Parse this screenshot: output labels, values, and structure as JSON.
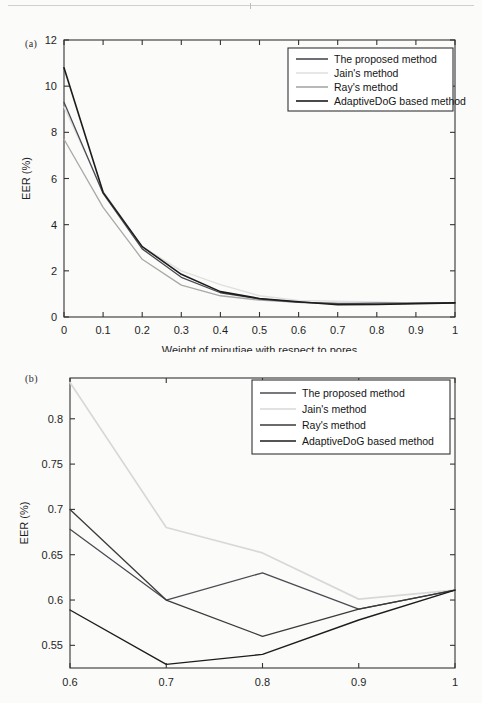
{
  "page": {
    "background_color": "#fbfbfa",
    "figure_count": 2
  },
  "series_styles": {
    "proposed": "#4a4a52",
    "jain": "#d2d2d2",
    "ray": "#9a9a9a",
    "adaptivedog": "#1c1c1c"
  },
  "figure_a": {
    "panel_tag": "(a)",
    "legend": {
      "position": "top-right",
      "items": [
        {
          "label": "The proposed method",
          "color": "#4a4a52"
        },
        {
          "label": "Jain's method",
          "color": "#e2e2e2"
        },
        {
          "label": "Ray's method",
          "color": "#a8a8a8"
        },
        {
          "label": "AdaptiveDoG based method",
          "color": "#1c1c1c"
        }
      ]
    },
    "chart_data": {
      "type": "line",
      "title": "",
      "xlabel": "Weight of minutiae with respect to pores",
      "ylabel": "EER (%)",
      "xlim": [
        0,
        1
      ],
      "ylim": [
        0,
        12
      ],
      "grid": false,
      "legend_position": "upper right",
      "xticks": [
        "0",
        "0.1",
        "0.2",
        "0.3",
        "0.4",
        "0.5",
        "0.6",
        "0.7",
        "0.8",
        "0.9",
        "1"
      ],
      "xtick_values": [
        0,
        0.1,
        0.2,
        0.3,
        0.4,
        0.5,
        0.6,
        0.7,
        0.8,
        0.9,
        1
      ],
      "yticks": [
        "0",
        "2",
        "4",
        "6",
        "8",
        "10",
        "12"
      ],
      "ytick_values": [
        0,
        2,
        4,
        6,
        8,
        10,
        12
      ],
      "x": [
        0,
        0.1,
        0.2,
        0.3,
        0.4,
        0.5,
        0.6,
        0.7,
        0.8,
        0.9,
        1
      ],
      "series": [
        {
          "name": "The proposed method",
          "color": "#4a4a52",
          "width": 1.3,
          "values": [
            9.3,
            5.35,
            2.95,
            1.72,
            1.05,
            0.78,
            0.64,
            0.58,
            0.6,
            0.6,
            0.61
          ]
        },
        {
          "name": "Jain's method",
          "color": "#e0e0e0",
          "width": 1.4,
          "values": [
            9.1,
            5.45,
            3.05,
            2.0,
            1.4,
            0.92,
            0.72,
            0.68,
            0.65,
            0.6,
            0.61
          ]
        },
        {
          "name": "Ray's method",
          "color": "#a8a8a8",
          "width": 1.3,
          "values": [
            7.7,
            4.75,
            2.5,
            1.38,
            0.92,
            0.73,
            0.63,
            0.6,
            0.56,
            0.59,
            0.61
          ]
        },
        {
          "name": "AdaptiveDoG based method",
          "color": "#1c1c1c",
          "width": 1.6,
          "values": [
            10.8,
            5.4,
            3.05,
            1.85,
            1.1,
            0.8,
            0.66,
            0.53,
            0.54,
            0.58,
            0.61
          ]
        }
      ]
    }
  },
  "figure_b": {
    "panel_tag": "(b)",
    "legend": {
      "position": "top-right",
      "items": [
        {
          "label": "The proposed method",
          "color": "#4a4a52"
        },
        {
          "label": "Jain's method",
          "color": "#d8d8d8"
        },
        {
          "label": "Ray's method",
          "color": "#3a3a3a"
        },
        {
          "label": "AdaptiveDoG based method",
          "color": "#1c1c1c"
        }
      ]
    },
    "chart_data": {
      "type": "line",
      "title": "",
      "xlabel": "",
      "ylabel": "EER (%)",
      "xlim": [
        0.6,
        1
      ],
      "ylim": [
        0.525,
        0.845
      ],
      "grid": false,
      "legend_position": "upper right",
      "xticks": [
        "0.6",
        "0.7",
        "0.8",
        "0.9",
        "1"
      ],
      "xtick_values": [
        0.6,
        0.7,
        0.8,
        0.9,
        1
      ],
      "yticks": [
        "0.55",
        "0.6",
        "0.65",
        "0.7",
        "0.75",
        "0.8"
      ],
      "ytick_values": [
        0.55,
        0.6,
        0.65,
        0.7,
        0.75,
        0.8
      ],
      "x": [
        0.6,
        0.7,
        0.8,
        0.9,
        1
      ],
      "series": [
        {
          "name": "The proposed method",
          "color": "#4a4a52",
          "width": 1.3,
          "values": [
            0.678,
            0.6,
            0.63,
            0.59,
            0.611
          ]
        },
        {
          "name": "Jain's method",
          "color": "#d8d8d8",
          "width": 1.7,
          "values": [
            0.84,
            0.68,
            0.652,
            0.601,
            0.611
          ]
        },
        {
          "name": "Ray's method",
          "color": "#3a3a3a",
          "width": 1.3,
          "values": [
            0.7,
            0.6,
            0.56,
            0.59,
            0.611
          ]
        },
        {
          "name": "AdaptiveDoG based method",
          "color": "#1c1c1c",
          "width": 1.4,
          "values": [
            0.589,
            0.529,
            0.54,
            0.578,
            0.611
          ]
        }
      ]
    }
  }
}
